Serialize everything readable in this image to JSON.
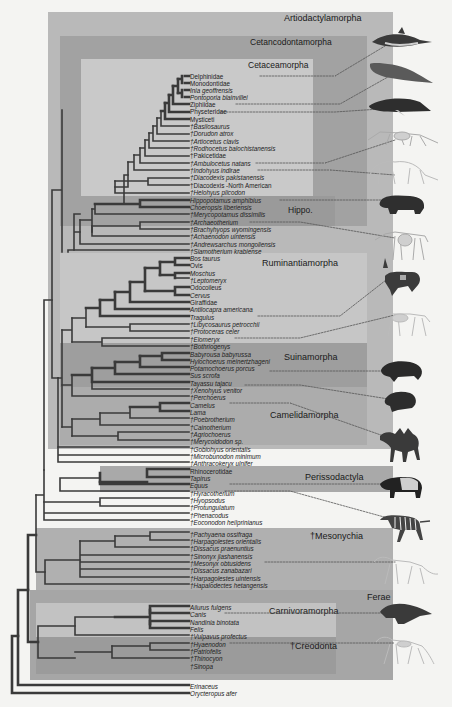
{
  "clades": [
    {
      "id": "artiodactylamorpha",
      "label": "Artiodactylamorpha"
    },
    {
      "id": "cetancodontamorpha",
      "label": "Cetancodontamorpha"
    },
    {
      "id": "cetaceamorpha",
      "label": "Cetaceamorpha"
    },
    {
      "id": "hippo",
      "label": "Hippo."
    },
    {
      "id": "ruminantiamorpha",
      "label": "Ruminantiamorpha"
    },
    {
      "id": "suinamorpha",
      "label": "Suinamorpha"
    },
    {
      "id": "camelidamorpha",
      "label": "Camelidamorpha"
    },
    {
      "id": "perissodactyla",
      "label": "Perissodactyla"
    },
    {
      "id": "mesonychia",
      "label": "†Mesonychia"
    },
    {
      "id": "ferae",
      "label": "Ferae"
    },
    {
      "id": "carnivoramorpha",
      "label": "Carnivoramorpha"
    },
    {
      "id": "creodonta",
      "label": "†Creodonta"
    }
  ],
  "taxa": [
    {
      "name": "Delphinidae",
      "italic": false
    },
    {
      "name": "Monodontidae",
      "italic": false
    },
    {
      "name": "Inia geoffrensis",
      "italic": true
    },
    {
      "name": "Pontoporia blainvillei",
      "italic": true
    },
    {
      "name": "Ziphiidae",
      "italic": false
    },
    {
      "name": "Physeteridae",
      "italic": false
    },
    {
      "name": "Mysticeti",
      "italic": false
    },
    {
      "name": "†Basilosaurus",
      "italic": true
    },
    {
      "name": "†Dorudon atrox",
      "italic": true
    },
    {
      "name": "†Artiocetus clavis",
      "italic": true
    },
    {
      "name": "†Rodhocetus balochistanensis",
      "italic": true
    },
    {
      "name": "†Pakicetidae",
      "italic": false
    },
    {
      "name": "†Ambulocetus natans",
      "italic": true
    },
    {
      "name": "†Indohyus indirae",
      "italic": true
    },
    {
      "name": "†Diacodexis pakistanensis",
      "italic": true
    },
    {
      "name": "†Diacodexis -North American",
      "italic": false
    },
    {
      "name": "†Helohyus plicodon",
      "italic": true
    },
    {
      "name": "Hippopotamus amphibius",
      "italic": true
    },
    {
      "name": "Choeropsis liberiensis",
      "italic": true
    },
    {
      "name": "†Merycopotamus dissimilis",
      "italic": true
    },
    {
      "name": "†Archaeotherium",
      "italic": true
    },
    {
      "name": "†Brachyhyops wyomingensis",
      "italic": true
    },
    {
      "name": "†Achaenodon uintensis",
      "italic": true
    },
    {
      "name": "†Andrewsarchus mongoliensis",
      "italic": true
    },
    {
      "name": "†Siamotherium krabiense",
      "italic": true
    },
    {
      "name": "Bos taurus",
      "italic": true
    },
    {
      "name": "Ovis",
      "italic": false
    },
    {
      "name": "Moschus",
      "italic": true
    },
    {
      "name": "†Leptomeryx",
      "italic": true
    },
    {
      "name": "Odocoileus",
      "italic": false
    },
    {
      "name": "Cervus",
      "italic": true
    },
    {
      "name": "Giraffidae",
      "italic": false
    },
    {
      "name": "Antilocapra americana",
      "italic": true
    },
    {
      "name": "Tragulus",
      "italic": true
    },
    {
      "name": "†Libycosaurus petrocchii",
      "italic": true
    },
    {
      "name": "†Protoceras celer",
      "italic": true
    },
    {
      "name": "†Elomeryx",
      "italic": true
    },
    {
      "name": "†Bothriogenys",
      "italic": true
    },
    {
      "name": "Babyrousa babyrussa",
      "italic": true
    },
    {
      "name": "Hylochoerus meinertzhageni",
      "italic": true
    },
    {
      "name": "Potamochoerus porcus",
      "italic": true
    },
    {
      "name": "Sus scrofa",
      "italic": true
    },
    {
      "name": "Tayassu tajacu",
      "italic": true
    },
    {
      "name": "†Xenohyus venitor",
      "italic": true
    },
    {
      "name": "†Perchoerus",
      "italic": true
    },
    {
      "name": "Camelus",
      "italic": true
    },
    {
      "name": "Lama",
      "italic": true
    },
    {
      "name": "†Poebrotherium",
      "italic": true
    },
    {
      "name": "†Cainotherium",
      "italic": true
    },
    {
      "name": "†Agriochoerus",
      "italic": true
    },
    {
      "name": "†Merycoidodon sp.",
      "italic": true
    },
    {
      "name": "†Gobiohyus orientalis",
      "italic": true
    },
    {
      "name": "†Microbunodon minimum",
      "italic": true
    },
    {
      "name": "†Anthracokeryx ulnifer",
      "italic": true
    },
    {
      "name": "Rhinocerotidae",
      "italic": false
    },
    {
      "name": "Tapirus",
      "italic": true
    },
    {
      "name": "Equus",
      "italic": true
    },
    {
      "name": "†Hyracotherium",
      "italic": true
    },
    {
      "name": "†Hyopsodus",
      "italic": true
    },
    {
      "name": "†Protungulatum",
      "italic": true
    },
    {
      "name": "†Phenacodus",
      "italic": true
    },
    {
      "name": "†Eoconodon heilprinianus",
      "italic": true
    },
    {
      "name": "†Pachyaena ossifraga",
      "italic": true
    },
    {
      "name": "†Harpagolestes orientalis",
      "italic": true
    },
    {
      "name": "†Dissacus praenuntius",
      "italic": true
    },
    {
      "name": "†Sinonyx jiashanensis",
      "italic": true
    },
    {
      "name": "†Mesonyx obtusidens",
      "italic": true
    },
    {
      "name": "†Dissacus zanabazari",
      "italic": true
    },
    {
      "name": "†Harpagolestes uintensis",
      "italic": true
    },
    {
      "name": "†Hapalodectes hetangensis",
      "italic": true
    },
    {
      "name": "Ailurus fulgens",
      "italic": true
    },
    {
      "name": "Canis",
      "italic": true
    },
    {
      "name": "Nandinia binotata",
      "italic": true
    },
    {
      "name": "Felis",
      "italic": true
    },
    {
      "name": "†Vulpavus profectus",
      "italic": true
    },
    {
      "name": "†Hyaenodon",
      "italic": true
    },
    {
      "name": "†Patriofelis",
      "italic": true
    },
    {
      "name": "†Thinocyon",
      "italic": true
    },
    {
      "name": "†Sinopa",
      "italic": true
    },
    {
      "name": "Erinaceus",
      "italic": true
    },
    {
      "name": "Orycteropus afer",
      "italic": true
    }
  ],
  "illustrations": [
    {
      "name": "dolphin",
      "linked_taxon": "Delphinidae"
    },
    {
      "name": "sperm-whale",
      "linked_taxon": "Physeteridae"
    },
    {
      "name": "humpback-whale",
      "linked_taxon": "Mysticeti"
    },
    {
      "name": "ambulocetus-skeleton",
      "linked_taxon": "†Ambulocetus natans"
    },
    {
      "name": "indohyus-skeleton",
      "linked_taxon": "†Indohyus indirae"
    },
    {
      "name": "hippopotamus",
      "linked_taxon": "Hippopotamus amphibius"
    },
    {
      "name": "archaeotherium-skeleton",
      "linked_taxon": "†Archaeotherium"
    },
    {
      "name": "pronghorn",
      "linked_taxon": "Antilocapra americana"
    },
    {
      "name": "elomeryx-skeleton",
      "linked_taxon": "†Elomeryx"
    },
    {
      "name": "boar",
      "linked_taxon": "Potamochoerus porcus"
    },
    {
      "name": "peccary",
      "linked_taxon": "Tayassu tajacu"
    },
    {
      "name": "camel",
      "linked_taxon": "Camelus"
    },
    {
      "name": "tapir",
      "linked_taxon": "Tapirus"
    },
    {
      "name": "zebra",
      "linked_taxon": "Equus"
    },
    {
      "name": "mesonyx-skeleton",
      "linked_taxon": "†Mesonyx obtusidens"
    },
    {
      "name": "wolf",
      "linked_taxon": "Canis"
    },
    {
      "name": "hyaenodon-skeleton",
      "linked_taxon": "†Hyaenodon"
    }
  ],
  "colors": {
    "background": "#f4f4f2",
    "artiodactylamorpha": "#b9b9b9",
    "cetancodontamorpha": "#a2a2a2",
    "cetaceamorpha": "#c9c9c9",
    "hippo": "#9a9a9a",
    "ruminantiamorpha": "#c6c6c6",
    "suinamorpha": "#9e9e9e",
    "camelidamorpha": "#acacac",
    "perissodactyla": "#a9a9a9",
    "mesonychia": "#b0b0b0",
    "ferae": "#a6a6a6",
    "carnivoramorpha": "#c2c2c2",
    "creodonta": "#9b9b9b",
    "branch": "#3a3a3a",
    "text": "#222222"
  }
}
